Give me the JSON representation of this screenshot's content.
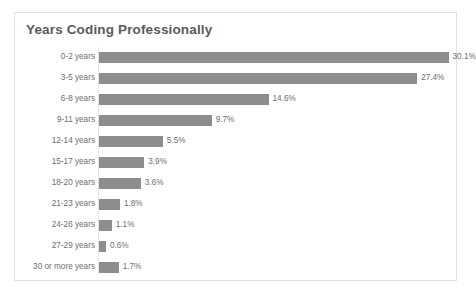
{
  "chart_data": {
    "type": "bar",
    "orientation": "horizontal",
    "title": "Years Coding Professionally",
    "xlabel": "",
    "ylabel": "",
    "xlim": [
      0,
      31
    ],
    "grid": false,
    "legend": null,
    "value_suffix": "%",
    "bar_color": "#8d8d8d",
    "title_color": "#5a5a5a",
    "label_color": "#6e6e6e",
    "frame_color": "#e2e2e2",
    "categories": [
      "0-2 years",
      "3-5 years",
      "6-8 years",
      "9-11 years",
      "12-14 years",
      "15-17 years",
      "18-20 years",
      "21-23 years",
      "24-26 years",
      "27-29 years",
      "30 or more years"
    ],
    "values": [
      30.1,
      27.4,
      14.6,
      9.7,
      5.5,
      3.9,
      3.6,
      1.8,
      1.1,
      0.6,
      1.7
    ],
    "value_labels": [
      "30.1%",
      "27.4%",
      "14.6%",
      "9.7%",
      "5.5%",
      "3.9%",
      "3.6%",
      "1.8%",
      "1.1%",
      "0.6%",
      "1.7%"
    ]
  }
}
